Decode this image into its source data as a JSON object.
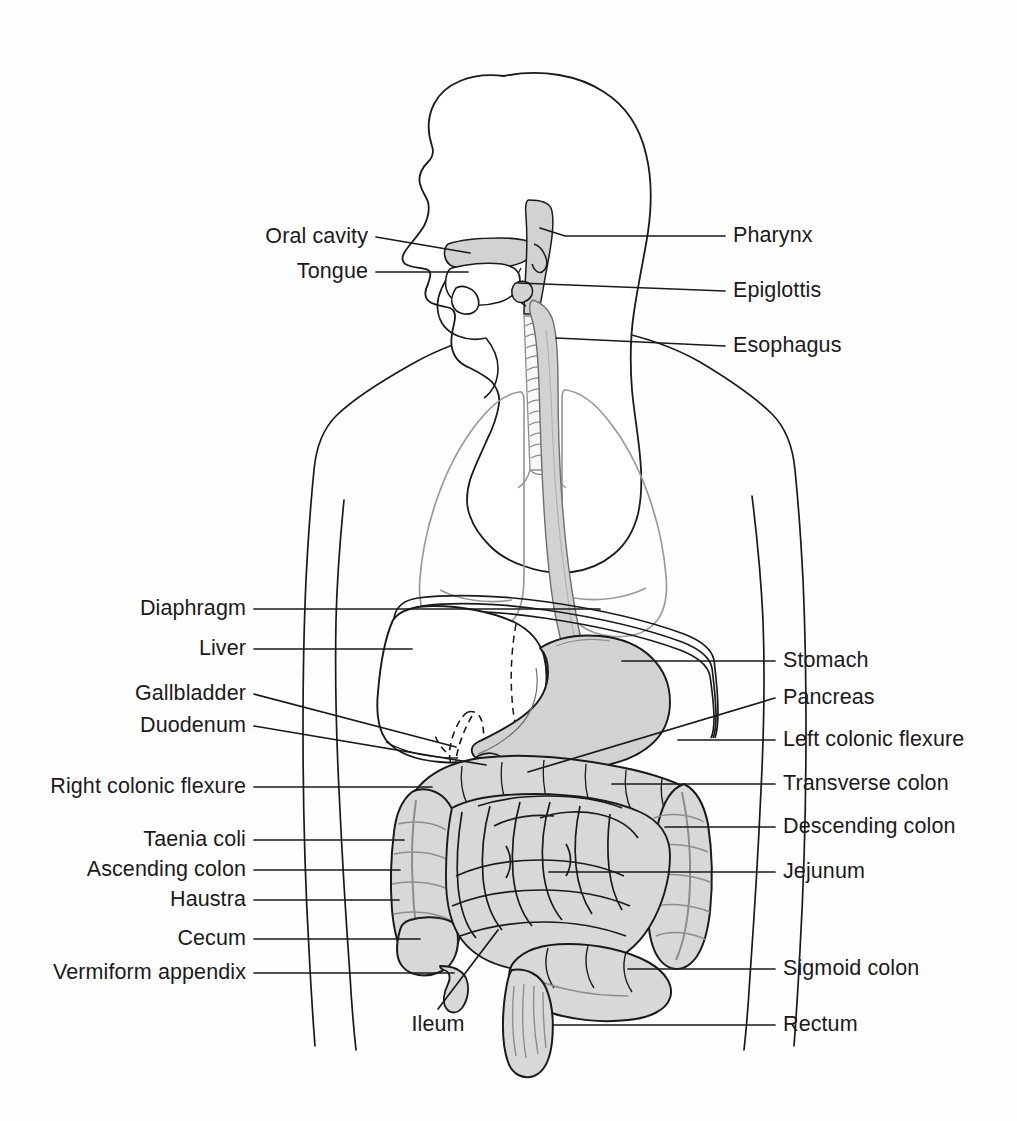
{
  "figure": {
    "background_color": "#ffffff",
    "line_color": "#1a1a1a",
    "label_color": "#1a1a1a",
    "organ_fill_gray": "#d2d2d2",
    "intestine_fill_gray": "#d8d8d8",
    "lung_outline_gray": "#9a9a9a",
    "pancreas_fill": "#ffffff"
  },
  "labels_left": [
    {
      "id": "oral-cavity",
      "text": "Oral cavity",
      "x": 368,
      "y": 237,
      "line_to_x": 470,
      "line_to_y": 253,
      "bend_x": null,
      "bend_y": null
    },
    {
      "id": "tongue",
      "text": "Tongue",
      "x": 368,
      "y": 272,
      "line_to_x": 468,
      "line_to_y": 272,
      "bend_x": null,
      "bend_y": null
    },
    {
      "id": "diaphragm",
      "text": "Diaphragm",
      "x": 246,
      "y": 609,
      "line_to_x": 600,
      "line_to_y": 609,
      "bend_x": null,
      "bend_y": null
    },
    {
      "id": "liver",
      "text": "Liver",
      "x": 246,
      "y": 649,
      "line_to_x": 412,
      "line_to_y": 649,
      "bend_x": null,
      "bend_y": null
    },
    {
      "id": "gallbladder",
      "text": "Gallbladder",
      "x": 246,
      "y": 694,
      "line_to_x": 456,
      "line_to_y": 747,
      "bend_x": null,
      "bend_y": null
    },
    {
      "id": "duodenum",
      "text": "Duodenum",
      "x": 246,
      "y": 726,
      "line_to_x": 486,
      "line_to_y": 765,
      "bend_x": null,
      "bend_y": null
    },
    {
      "id": "right-colonic-flexure",
      "text": "Right colonic flexure",
      "x": 246,
      "y": 787,
      "line_to_x": 432,
      "line_to_y": 787,
      "bend_x": null,
      "bend_y": null
    },
    {
      "id": "taenia-coli",
      "text": "Taenia coli",
      "x": 246,
      "y": 840,
      "line_to_x": 404,
      "line_to_y": 840,
      "bend_x": null,
      "bend_y": null
    },
    {
      "id": "ascending-colon",
      "text": "Ascending colon",
      "x": 246,
      "y": 870,
      "line_to_x": 400,
      "line_to_y": 870,
      "bend_x": null,
      "bend_y": null
    },
    {
      "id": "haustra",
      "text": "Haustra",
      "x": 246,
      "y": 900,
      "line_to_x": 399,
      "line_to_y": 900,
      "bend_x": null,
      "bend_y": null
    },
    {
      "id": "cecum",
      "text": "Cecum",
      "x": 246,
      "y": 939,
      "line_to_x": 420,
      "line_to_y": 939,
      "bend_x": null,
      "bend_y": null
    },
    {
      "id": "vermiform-appendix",
      "text": "Vermiform appendix",
      "x": 246,
      "y": 973,
      "line_to_x": 454,
      "line_to_y": 973,
      "bend_x": null,
      "bend_y": null
    }
  ],
  "labels_right": [
    {
      "id": "pharynx",
      "text": "Pharynx",
      "x": 733,
      "y": 236,
      "line_to_x": 540,
      "line_to_y": 228,
      "bend_x": 565,
      "bend_y": 236
    },
    {
      "id": "epiglottis",
      "text": "Epiglottis",
      "x": 733,
      "y": 291,
      "line_to_x": 518,
      "line_to_y": 283,
      "bend_x": null,
      "bend_y": null
    },
    {
      "id": "esophagus",
      "text": "Esophagus",
      "x": 733,
      "y": 346,
      "line_to_x": 556,
      "line_to_y": 338,
      "bend_x": null,
      "bend_y": null
    },
    {
      "id": "stomach",
      "text": "Stomach",
      "x": 783,
      "y": 661,
      "line_to_x": 622,
      "line_to_y": 661,
      "bend_x": null,
      "bend_y": null
    },
    {
      "id": "pancreas",
      "text": "Pancreas",
      "x": 783,
      "y": 698,
      "line_to_x": 528,
      "line_to_y": 772,
      "bend_x": null,
      "bend_y": null
    },
    {
      "id": "left-colonic-flexure",
      "text": "Left colonic flexure",
      "x": 783,
      "y": 740,
      "line_to_x": 678,
      "line_to_y": 740,
      "bend_x": null,
      "bend_y": null
    },
    {
      "id": "transverse-colon",
      "text": "Transverse colon",
      "x": 783,
      "y": 784,
      "line_to_x": 612,
      "line_to_y": 784,
      "bend_x": null,
      "bend_y": null
    },
    {
      "id": "descending-colon",
      "text": "Descending colon",
      "x": 783,
      "y": 827,
      "line_to_x": 665,
      "line_to_y": 827,
      "bend_x": null,
      "bend_y": null
    },
    {
      "id": "jejunum",
      "text": "Jejunum",
      "x": 783,
      "y": 872,
      "line_to_x": 549,
      "line_to_y": 872,
      "bend_x": null,
      "bend_y": null
    },
    {
      "id": "sigmoid-colon",
      "text": "Sigmoid colon",
      "x": 783,
      "y": 969,
      "line_to_x": 628,
      "line_to_y": 969,
      "bend_x": null,
      "bend_y": null
    },
    {
      "id": "rectum",
      "text": "Rectum",
      "x": 783,
      "y": 1025,
      "line_to_x": 554,
      "line_to_y": 1025,
      "bend_x": null,
      "bend_y": null
    }
  ],
  "labels_free": [
    {
      "id": "ileum",
      "text": "Ileum",
      "x": 438,
      "y": 1025,
      "line_to_x": 498,
      "line_to_y": 930
    }
  ],
  "organs": [
    {
      "id": "head-profile",
      "name": "Head (sagittal profile)",
      "fill": "none",
      "stroke": "#1a1a1a"
    },
    {
      "id": "oral-cavity",
      "name": "Oral cavity",
      "fill": "#d2d2d2",
      "stroke": "#1a1a1a"
    },
    {
      "id": "tongue",
      "name": "Tongue",
      "fill": "none",
      "stroke": "#1a1a1a"
    },
    {
      "id": "pharynx",
      "name": "Pharynx",
      "fill": "#d2d2d2",
      "stroke": "#1a1a1a"
    },
    {
      "id": "epiglottis",
      "name": "Epiglottis",
      "fill": "#d2d2d2",
      "stroke": "#1a1a1a"
    },
    {
      "id": "trachea",
      "name": "Trachea with cartilage rings",
      "fill": "#f4f4f4",
      "stroke": "#8a8a8a"
    },
    {
      "id": "esophagus",
      "name": "Esophagus",
      "fill": "#d2d2d2",
      "stroke": "#6a6a6a"
    },
    {
      "id": "lungs",
      "name": "Lungs",
      "fill": "none",
      "stroke": "#9a9a9a"
    },
    {
      "id": "diaphragm",
      "name": "Diaphragm",
      "fill": "none",
      "stroke": "#1a1a1a"
    },
    {
      "id": "liver",
      "name": "Liver",
      "fill": "#ffffff",
      "stroke": "#1a1a1a"
    },
    {
      "id": "gallbladder",
      "name": "Gallbladder (dashed)",
      "fill": "none",
      "stroke": "#1a1a1a"
    },
    {
      "id": "stomach",
      "name": "Stomach",
      "fill": "#d2d2d2",
      "stroke": "#1a1a1a"
    },
    {
      "id": "duodenum",
      "name": "Duodenum",
      "fill": "none",
      "stroke": "#1a1a1a"
    },
    {
      "id": "pancreas",
      "name": "Pancreas (stippled)",
      "fill": "#ffffff",
      "stroke": "#1a1a1a"
    },
    {
      "id": "transverse-colon",
      "name": "Transverse colon",
      "fill": "#d8d8d8",
      "stroke": "#1a1a1a"
    },
    {
      "id": "ascending-colon",
      "name": "Ascending colon",
      "fill": "#d8d8d8",
      "stroke": "#1a1a1a"
    },
    {
      "id": "descending-colon",
      "name": "Descending colon",
      "fill": "#d8d8d8",
      "stroke": "#1a1a1a"
    },
    {
      "id": "small-intestine",
      "name": "Small intestine (jejunum and ileum)",
      "fill": "#d8d8d8",
      "stroke": "#1a1a1a"
    },
    {
      "id": "cecum",
      "name": "Cecum",
      "fill": "#d8d8d8",
      "stroke": "#1a1a1a"
    },
    {
      "id": "vermiform-appendix",
      "name": "Vermiform appendix",
      "fill": "none",
      "stroke": "#1a1a1a"
    },
    {
      "id": "sigmoid-colon",
      "name": "Sigmoid colon",
      "fill": "#d8d8d8",
      "stroke": "#1a1a1a"
    },
    {
      "id": "rectum",
      "name": "Rectum",
      "fill": "#d8d8d8",
      "stroke": "#1a1a1a"
    },
    {
      "id": "torso-outline",
      "name": "Torso and arms outline",
      "fill": "none",
      "stroke": "#1a1a1a"
    }
  ]
}
